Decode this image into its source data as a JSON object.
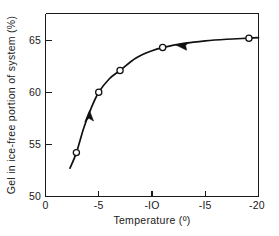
{
  "figure": {
    "background_color": "#ffffff",
    "line_color": "#101010",
    "marker_fill": "#ffffff"
  },
  "axes": {
    "x_title": "Temperature  (º)",
    "y_title": "Gel in ice-free portion of system  (%)",
    "x_ticks": [
      "0",
      "-5",
      "-IO",
      "-I5",
      "-20"
    ],
    "y_ticks": [
      "50",
      "55",
      "60",
      "65"
    ]
  },
  "chart_data": {
    "type": "line",
    "title": "",
    "xlabel": "Temperature  (º)",
    "ylabel": "Gel in ice-free portion of system  (%)",
    "xlim": [
      0,
      -20
    ],
    "ylim": [
      50,
      66.5
    ],
    "x_ticks": [
      0,
      -5,
      -10,
      -15,
      -20
    ],
    "y_ticks": [
      50,
      55,
      60,
      65
    ],
    "grid": false,
    "legend": "none",
    "x_axis_inverted": true,
    "series": [
      {
        "name": "Gel in ice-free portion of system",
        "marker": "open-circle",
        "x": [
          -2.9,
          -5.0,
          -7.0,
          -11.0,
          -19.1
        ],
        "values": [
          54.2,
          60.0,
          62.1,
          64.3,
          65.2
        ]
      }
    ],
    "curve_points": [
      [
        -2.3,
        52.7
      ],
      [
        -2.9,
        54.2
      ],
      [
        -3.6,
        56.6
      ],
      [
        -4.3,
        58.5
      ],
      [
        -5.0,
        60.0
      ],
      [
        -6.0,
        61.3
      ],
      [
        -7.0,
        62.1
      ],
      [
        -8.5,
        63.3
      ],
      [
        -10.0,
        64.0
      ],
      [
        -11.0,
        64.3
      ],
      [
        -13.0,
        64.7
      ],
      [
        -15.0,
        64.95
      ],
      [
        -17.0,
        65.1
      ],
      [
        -19.1,
        65.2
      ],
      [
        -20.0,
        65.25
      ]
    ],
    "annotations": [
      {
        "name": "ascending-direction-arrow",
        "x": -4.2,
        "y": 58.3,
        "direction": "up-right"
      },
      {
        "name": "plateau-direction-arrow",
        "x": -12.6,
        "y": 64.6,
        "direction": "left"
      }
    ]
  },
  "caption": {
    "text": ""
  }
}
